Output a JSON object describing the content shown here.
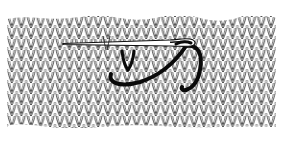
{
  "illustration": {
    "subject": "Duplicate stitch on stockinette knit fabric",
    "fabric": {
      "pattern": "stockinette-knit-stitches",
      "stroke_color": "#222222",
      "background": "#ffffff"
    },
    "needle": {
      "type": "tapestry-needle",
      "color": "#ffffff",
      "outline": "#111111"
    },
    "yarn": {
      "color": "#0a0a0a"
    },
    "colors": {
      "ink": "#111111",
      "paper": "#ffffff"
    }
  }
}
